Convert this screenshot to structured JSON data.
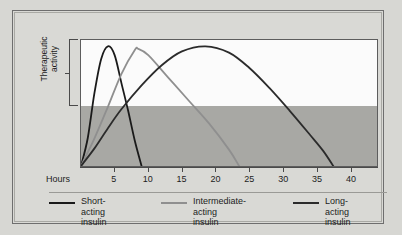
{
  "figure": {
    "background_color": "#d7d7d3",
    "frame_color": "#6e6e6e"
  },
  "axes": {
    "y_label": "Therapeutic\nactivity",
    "x_origin_label": "Hours",
    "x_ticks": [
      "5",
      "10",
      "15",
      "20",
      "25",
      "30",
      "35",
      "40"
    ]
  },
  "legend": {
    "items": [
      {
        "label": "Short-acting\ninsulin",
        "color": "#1a1a1a",
        "swatch_name": "legend-swatch-short-acting"
      },
      {
        "label": "Intermediate-acting\ninsulin",
        "color": "#8f8f8f",
        "swatch_name": "legend-swatch-intermediate-acting"
      },
      {
        "label": "Long-acting\ninsulin",
        "color": "#2b2b2b",
        "swatch_name": "legend-swatch-long-acting"
      }
    ]
  },
  "chart_data": {
    "type": "line",
    "title": "",
    "xlabel": "Hours",
    "ylabel": "Therapeutic activity",
    "xlim": [
      0,
      44
    ],
    "ylim": [
      0,
      1
    ],
    "grid": false,
    "legend_position": "bottom",
    "xticks": [
      5,
      10,
      15,
      20,
      25,
      30,
      35,
      40
    ],
    "yticks": [],
    "shaded_band": {
      "label": "lower activity region",
      "color": "#a8a8a4",
      "y_from": 0,
      "y_to": 0.48
    },
    "series": [
      {
        "name": "Short-acting insulin",
        "color": "#1a1a1a",
        "onset_hours": 0,
        "peak_hours": 4,
        "peak_value": 0.95,
        "duration_hours": 9,
        "points": [
          {
            "x": 0,
            "y": 0.0
          },
          {
            "x": 1,
            "y": 0.22
          },
          {
            "x": 2,
            "y": 0.58
          },
          {
            "x": 3,
            "y": 0.85
          },
          {
            "x": 4,
            "y": 0.95
          },
          {
            "x": 5,
            "y": 0.88
          },
          {
            "x": 6,
            "y": 0.66
          },
          {
            "x": 7,
            "y": 0.44
          },
          {
            "x": 8,
            "y": 0.2
          },
          {
            "x": 9,
            "y": 0.0
          }
        ]
      },
      {
        "name": "Intermediate-acting insulin",
        "color": "#8f8f8f",
        "onset_hours": 0,
        "peak_hours": 8.5,
        "peak_value": 0.93,
        "duration_hours": 23.5,
        "points": [
          {
            "x": 0,
            "y": 0.0
          },
          {
            "x": 2,
            "y": 0.22
          },
          {
            "x": 4,
            "y": 0.47
          },
          {
            "x": 6,
            "y": 0.73
          },
          {
            "x": 8,
            "y": 0.92
          },
          {
            "x": 8.5,
            "y": 0.93
          },
          {
            "x": 10,
            "y": 0.88
          },
          {
            "x": 13,
            "y": 0.7
          },
          {
            "x": 16,
            "y": 0.52
          },
          {
            "x": 19,
            "y": 0.34
          },
          {
            "x": 22,
            "y": 0.13
          },
          {
            "x": 23.5,
            "y": 0.0
          }
        ]
      },
      {
        "name": "Long-acting insulin",
        "color": "#2b2b2b",
        "onset_hours": 0,
        "peak_hours": 18.5,
        "peak_value": 0.95,
        "duration_hours": 37.5,
        "points": [
          {
            "x": 0,
            "y": 0.0
          },
          {
            "x": 2,
            "y": 0.14
          },
          {
            "x": 4,
            "y": 0.3
          },
          {
            "x": 6,
            "y": 0.45
          },
          {
            "x": 9,
            "y": 0.64
          },
          {
            "x": 12,
            "y": 0.8
          },
          {
            "x": 15,
            "y": 0.91
          },
          {
            "x": 18.5,
            "y": 0.95
          },
          {
            "x": 22,
            "y": 0.9
          },
          {
            "x": 25,
            "y": 0.78
          },
          {
            "x": 28,
            "y": 0.62
          },
          {
            "x": 31,
            "y": 0.44
          },
          {
            "x": 34,
            "y": 0.25
          },
          {
            "x": 36,
            "y": 0.12
          },
          {
            "x": 37.5,
            "y": 0.0
          }
        ]
      }
    ]
  }
}
